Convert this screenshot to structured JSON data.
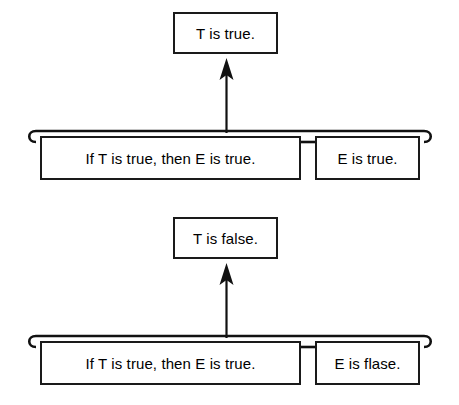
{
  "diagram": {
    "background_color": "#ffffff",
    "stroke_color": "#111111",
    "arguments": [
      {
        "id": "modus-ponens",
        "conclusion": "T is true.",
        "premises": [
          "If T is true, then E is true.",
          "E is true."
        ],
        "arrow": "up-arrow-icon"
      },
      {
        "id": "modus-tollens",
        "conclusion": "T is false.",
        "premises": [
          "If T is true, then E is true.",
          "E is flase."
        ],
        "arrow": "up-arrow-icon"
      }
    ]
  }
}
